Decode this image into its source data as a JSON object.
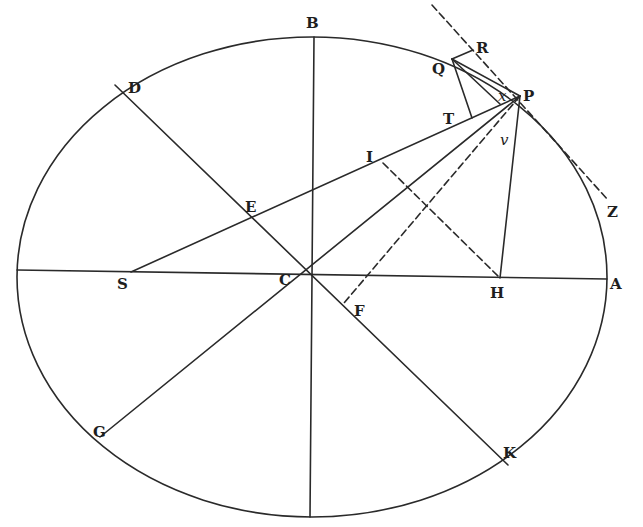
{
  "figure": {
    "title": "",
    "stroke_color": "#2a2a2a",
    "background": "#ffffff"
  },
  "ellipse": {
    "cx": 312,
    "cy": 277,
    "rx": 295,
    "ry": 240
  },
  "points": {
    "A": {
      "label": "A",
      "x": 607,
      "y": 279
    },
    "B": {
      "label": "B",
      "x": 314,
      "y": 37
    },
    "C": {
      "label": "C",
      "x": 312,
      "y": 275
    },
    "D": {
      "label": "D",
      "x": 115,
      "y": 85
    },
    "E": {
      "label": "E",
      "x": 251,
      "y": 218
    },
    "F": {
      "label": "F",
      "x": 344,
      "y": 303
    },
    "G": {
      "label": "G",
      "x": 100,
      "y": 437
    },
    "H": {
      "label": "H",
      "x": 500,
      "y": 278
    },
    "I": {
      "label": "I",
      "x": 383,
      "y": 163
    },
    "K": {
      "label": "K",
      "x": 508,
      "y": 465
    },
    "P": {
      "label": "P",
      "x": 520,
      "y": 96
    },
    "Q": {
      "label": "Q",
      "x": 452,
      "y": 59
    },
    "R": {
      "label": "R",
      "x": 473,
      "y": 50
    },
    "S": {
      "label": "S",
      "x": 131,
      "y": 272
    },
    "T": {
      "label": "T",
      "x": 462,
      "y": 121
    },
    "x": {
      "label": "x",
      "x": 497,
      "y": 98
    },
    "v": {
      "label": "v",
      "x": 503,
      "y": 135
    },
    "Z": {
      "label": "Z",
      "x": 608,
      "y": 200
    }
  },
  "labels": [
    {
      "id": "B",
      "text": "B",
      "x": 306,
      "y": 28,
      "italic": false
    },
    {
      "id": "D",
      "text": "D",
      "x": 128,
      "y": 93,
      "italic": false
    },
    {
      "id": "E",
      "text": "E",
      "x": 245,
      "y": 212,
      "italic": false
    },
    {
      "id": "I",
      "text": "I",
      "x": 366,
      "y": 162,
      "italic": false
    },
    {
      "id": "T",
      "text": "T",
      "x": 443,
      "y": 124,
      "italic": false
    },
    {
      "id": "Q",
      "text": "Q",
      "x": 432,
      "y": 74,
      "italic": false
    },
    {
      "id": "R",
      "text": "R",
      "x": 476,
      "y": 53,
      "italic": false
    },
    {
      "id": "x",
      "text": "x",
      "x": 498,
      "y": 101,
      "italic": true
    },
    {
      "id": "P",
      "text": "P",
      "x": 523,
      "y": 101,
      "italic": false
    },
    {
      "id": "v",
      "text": "v",
      "x": 500,
      "y": 145,
      "italic": true
    },
    {
      "id": "Z",
      "text": "Z",
      "x": 607,
      "y": 217,
      "italic": false
    },
    {
      "id": "S",
      "text": "S",
      "x": 117,
      "y": 289,
      "italic": false
    },
    {
      "id": "C",
      "text": "C",
      "x": 279,
      "y": 285,
      "italic": false
    },
    {
      "id": "H",
      "text": "H",
      "x": 490,
      "y": 298,
      "italic": false
    },
    {
      "id": "A",
      "text": "A",
      "x": 610,
      "y": 289,
      "italic": false
    },
    {
      "id": "F",
      "text": "F",
      "x": 354,
      "y": 316,
      "italic": false
    },
    {
      "id": "G",
      "text": "G",
      "x": 93,
      "y": 437,
      "italic": false
    },
    {
      "id": "K",
      "text": "K",
      "x": 503,
      "y": 458,
      "italic": false
    }
  ],
  "segments": [
    {
      "id": "major-axis",
      "from": [
        17,
        270
      ],
      "to": [
        607,
        279
      ],
      "dashed": false
    },
    {
      "id": "minor-axis-BC",
      "from": [
        314,
        37
      ],
      "to": [
        310,
        517
      ],
      "dashed": false
    },
    {
      "id": "diameter-DK",
      "from": [
        115,
        85
      ],
      "to": [
        508,
        465
      ],
      "dashed": false
    },
    {
      "id": "diameter-PG",
      "from": [
        520,
        96
      ],
      "to": [
        100,
        437
      ],
      "dashed": false
    },
    {
      "id": "line-SP",
      "from": [
        131,
        272
      ],
      "to": [
        520,
        96
      ],
      "dashed": false
    },
    {
      "id": "line-PH",
      "from": [
        520,
        96
      ],
      "to": [
        500,
        278
      ],
      "dashed": false
    },
    {
      "id": "line-IH",
      "from": [
        383,
        163
      ],
      "to": [
        500,
        278
      ],
      "dashed": true
    },
    {
      "id": "line-PF",
      "from": [
        520,
        96
      ],
      "to": [
        344,
        303
      ],
      "dashed": true
    },
    {
      "id": "tangent-RPZ",
      "from": [
        432,
        5
      ],
      "to": [
        608,
        200
      ],
      "dashed": true
    },
    {
      "id": "line-QR",
      "from": [
        452,
        59
      ],
      "to": [
        473,
        50
      ],
      "dashed": false
    },
    {
      "id": "line-QT",
      "from": [
        452,
        59
      ],
      "to": [
        472,
        118
      ],
      "dashed": false
    },
    {
      "id": "line-QP",
      "from": [
        452,
        59
      ],
      "to": [
        520,
        96
      ],
      "dashed": false
    },
    {
      "id": "line-Qx",
      "from": [
        452,
        59
      ],
      "to": [
        500,
        104
      ],
      "dashed": false
    }
  ]
}
